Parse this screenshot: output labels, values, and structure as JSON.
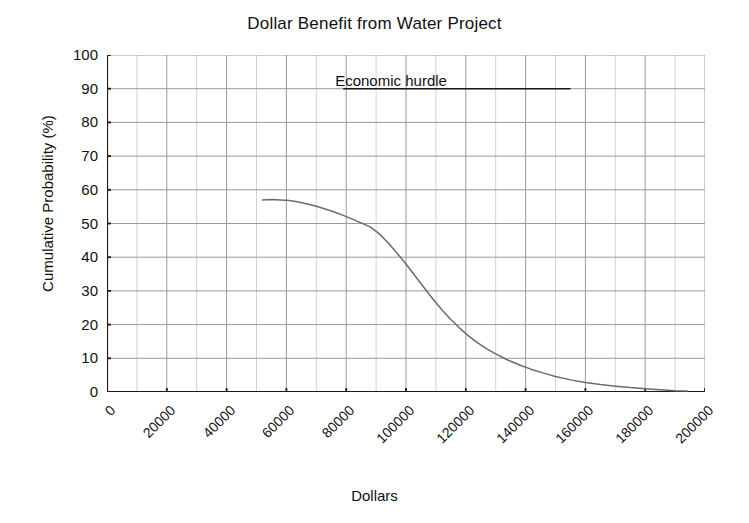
{
  "chart_data": {
    "type": "line",
    "title": "Dollar Benefit from Water Project",
    "xlabel": "Dollars",
    "ylabel": "Cumulative Probability (%)",
    "xlim": [
      0,
      200000
    ],
    "ylim": [
      0,
      100
    ],
    "grid": true,
    "legend": "none",
    "xticks": [
      "0",
      "20000",
      "40000",
      "60000",
      "80000",
      "100000",
      "120000",
      "140000",
      "160000",
      "180000",
      "200000"
    ],
    "xtick_values": [
      0,
      20000,
      40000,
      60000,
      80000,
      100000,
      120000,
      140000,
      160000,
      180000,
      200000
    ],
    "yticks": [
      "0",
      "10",
      "20",
      "30",
      "40",
      "50",
      "60",
      "70",
      "80",
      "90",
      "100"
    ],
    "ytick_values": [
      0,
      10,
      20,
      30,
      40,
      50,
      60,
      70,
      80,
      90,
      100
    ],
    "minor_grid_x_step": 10000,
    "line_color": "#6b6b6b",
    "grid_color": "#9a9a9a",
    "minor_grid_color": "#d2d2d2",
    "axis_color": "#1a1a1a",
    "annotations": [
      {
        "name": "economic-hurdle",
        "text": "Economic hurdle",
        "x": 95000,
        "y": 90,
        "line_x_start": 79000,
        "line_x_end": 155000,
        "line_y": 90
      }
    ],
    "series": [
      {
        "name": "Cumulative Probability",
        "x": [
          52000,
          55000,
          58000,
          61000,
          64000,
          67000,
          70000,
          73000,
          76000,
          79000,
          82000,
          85000,
          88000,
          91000,
          94000,
          97000,
          100000,
          103000,
          106000,
          109000,
          112000,
          115000,
          118000,
          121000,
          124000,
          127000,
          130000,
          134000,
          138000,
          142000,
          146000,
          150000,
          155000,
          160000,
          165000,
          170000,
          175000,
          180000,
          185000,
          190000,
          194000
        ],
        "y": [
          57.0,
          57.1,
          57.0,
          56.8,
          56.4,
          55.8,
          55.1,
          54.3,
          53.4,
          52.4,
          51.3,
          50.2,
          49.0,
          47.0,
          44.3,
          41.2,
          38.0,
          34.5,
          31.0,
          27.6,
          24.4,
          21.5,
          18.9,
          16.6,
          14.6,
          12.8,
          11.3,
          9.5,
          8.0,
          6.7,
          5.6,
          4.6,
          3.6,
          2.8,
          2.2,
          1.7,
          1.3,
          1.0,
          0.7,
          0.4,
          0.3
        ]
      }
    ]
  }
}
